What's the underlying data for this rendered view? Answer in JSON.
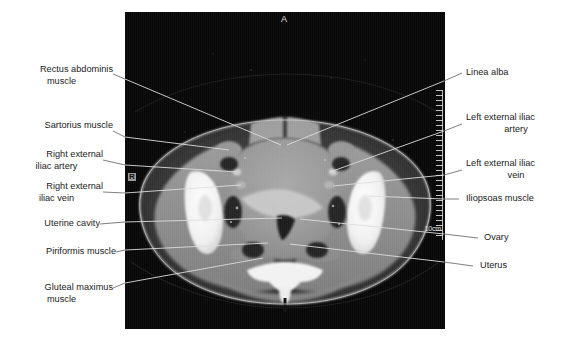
{
  "figure": {
    "type": "annotated-ct-scan",
    "modality": "CT",
    "plane": "axial",
    "region": "female pelvis",
    "background_color": "#ffffff",
    "scan_background_color": "#050505"
  },
  "scan_markers": {
    "anterior": "A",
    "right": "R",
    "scale_bar": "10cm"
  },
  "labels_left": [
    {
      "id": "rectus-abdominis-muscle",
      "line1": "Rectus abdominis",
      "line2": "muscle"
    },
    {
      "id": "sartorius-muscle",
      "line1": "Sartorius muscle",
      "line2": ""
    },
    {
      "id": "right-external-iliac-artery",
      "line1": "Right external",
      "line2": "iliac artery"
    },
    {
      "id": "right-external-iliac-vein",
      "line1": "Right external",
      "line2": "iliac vein"
    },
    {
      "id": "uterine-cavity",
      "line1": "Uterine cavity",
      "line2": ""
    },
    {
      "id": "piriformis-muscle",
      "line1": "Piriformis muscle",
      "line2": ""
    },
    {
      "id": "gluteal-maximus-muscle",
      "line1": "Gluteal maximus",
      "line2": "muscle"
    }
  ],
  "labels_right": [
    {
      "id": "linea-alba",
      "line1": "Linea alba",
      "line2": ""
    },
    {
      "id": "left-external-iliac-artery",
      "line1": "Left external iliac",
      "line2": "artery"
    },
    {
      "id": "left-external-iliac-vein",
      "line1": "Left external iliac",
      "line2": "vein"
    },
    {
      "id": "iliopsoas-muscle",
      "line1": "Iliopsoas muscle",
      "line2": ""
    },
    {
      "id": "ovary",
      "line1": "Ovary",
      "line2": ""
    },
    {
      "id": "uterus",
      "line1": "Uterus",
      "line2": ""
    }
  ],
  "colors": {
    "text": "#1b1b1b",
    "leader_line": "#d8d8d8",
    "leader_line_outside": "#6f6f6f",
    "bone": "#f4f4f4",
    "soft_tissue": "#8e8e8e",
    "fat": "#3b3b3b",
    "air": "#050505"
  }
}
